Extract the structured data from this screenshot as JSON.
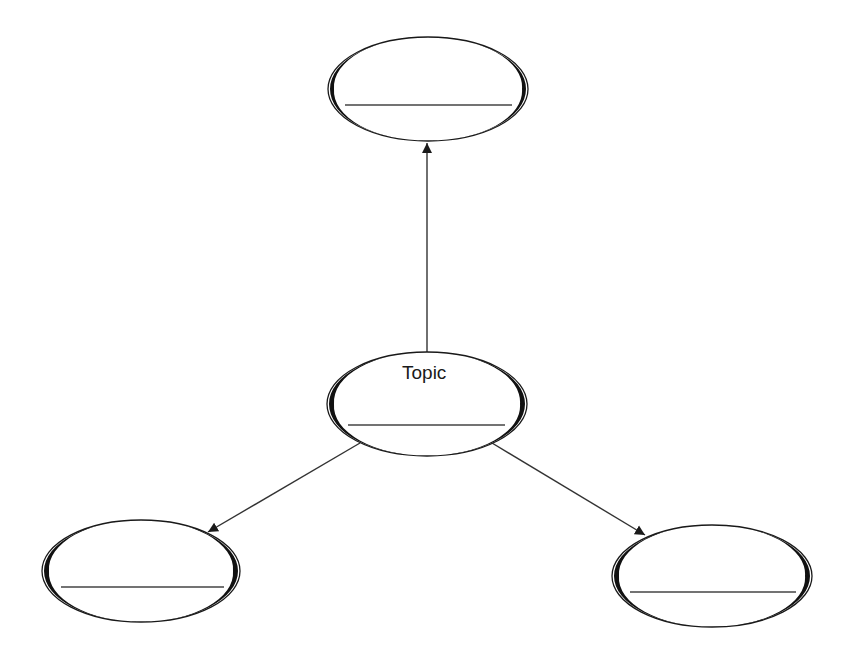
{
  "diagram": {
    "type": "concept-web",
    "center_node": {
      "label": "Topic",
      "cx": 427,
      "cy": 404,
      "rx": 100,
      "ry": 52,
      "line_y": 425
    },
    "nodes": [
      {
        "id": "top",
        "label": "",
        "cx": 428,
        "cy": 89,
        "rx": 100,
        "ry": 52,
        "line_y": 105
      },
      {
        "id": "bottom-left",
        "label": "",
        "cx": 141,
        "cy": 571,
        "rx": 99,
        "ry": 51,
        "line_y": 587
      },
      {
        "id": "bottom-right",
        "label": "",
        "cx": 712,
        "cy": 576,
        "rx": 100,
        "ry": 51,
        "line_y": 592
      }
    ],
    "edges": [
      {
        "from": "center",
        "to": "top",
        "x1": 427,
        "y1": 352,
        "x2": 427,
        "y2": 143
      },
      {
        "from": "center",
        "to": "bottom-left",
        "x1": 360,
        "y1": 443,
        "x2": 208,
        "y2": 532
      },
      {
        "from": "center",
        "to": "bottom-right",
        "x1": 492,
        "y1": 443,
        "x2": 645,
        "y2": 535
      }
    ],
    "colors": {
      "stroke": "#1a1a1a",
      "background": "#ffffff",
      "line": "#555555"
    }
  }
}
